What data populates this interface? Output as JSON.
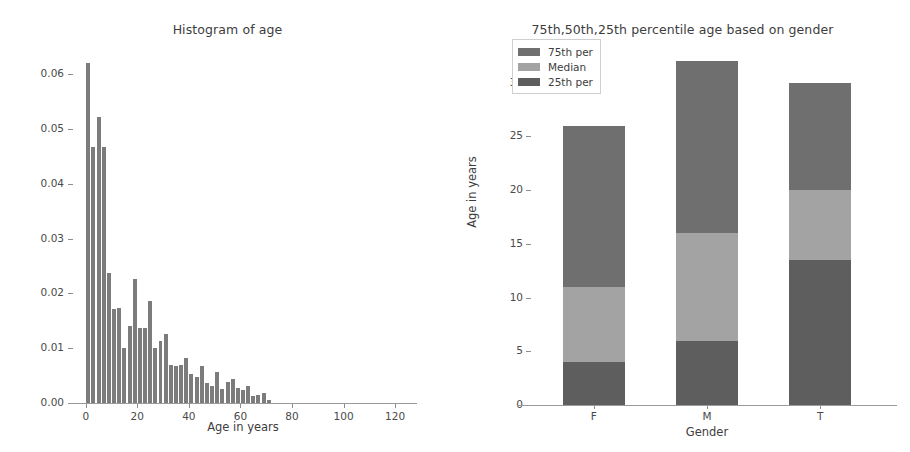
{
  "chart_data": [
    {
      "type": "bar",
      "title": "Histogram of age",
      "xlabel": "Age in years",
      "ylabel": "",
      "xlim": [
        -3,
        125
      ],
      "ylim": [
        0.0,
        0.0635
      ],
      "xticks": [
        "0",
        "20",
        "40",
        "60",
        "80",
        "100",
        "120"
      ],
      "xtick_values": [
        0,
        20,
        40,
        60,
        80,
        100,
        120
      ],
      "yticks": [
        "0.00",
        "0.01",
        "0.02",
        "0.03",
        "0.04",
        "0.05",
        "0.06"
      ],
      "ytick_values": [
        0.0,
        0.01,
        0.02,
        0.03,
        0.04,
        0.05,
        0.06
      ],
      "grid": false,
      "bar_color": "#7c7c7c",
      "bin_width": 2,
      "x": [
        1,
        3,
        5,
        7,
        9,
        11,
        13,
        15,
        17,
        19,
        21,
        23,
        25,
        27,
        29,
        31,
        33,
        35,
        37,
        39,
        41,
        43,
        45,
        47,
        49,
        51,
        53,
        55,
        57,
        59,
        61,
        63,
        65,
        67,
        69,
        71,
        73,
        75,
        77,
        79
      ],
      "values": [
        0.062,
        0.0467,
        0.0521,
        0.0467,
        0.0237,
        0.0172,
        0.0174,
        0.01,
        0.0141,
        0.0227,
        0.0137,
        0.0137,
        0.0186,
        0.01,
        0.0113,
        0.0126,
        0.007,
        0.0068,
        0.0069,
        0.0083,
        0.0053,
        0.0047,
        0.0068,
        0.0036,
        0.0031,
        0.0057,
        0.0025,
        0.0039,
        0.0044,
        0.0027,
        0.0023,
        0.0031,
        0.0013,
        0.0014,
        0.0018,
        0.0006,
        0.0,
        0.0,
        0.0,
        0.0
      ]
    },
    {
      "type": "bar",
      "subtype": "stacked",
      "title": "75th,50th,25th percentile age based on gender",
      "xlabel": "Gender",
      "ylabel": "Age in years",
      "categories": [
        "F",
        "M",
        "T"
      ],
      "ylim": [
        0,
        33.5
      ],
      "yticks": [
        "0",
        "5",
        "10",
        "15",
        "20",
        "25",
        "30"
      ],
      "ytick_values": [
        0,
        5,
        10,
        15,
        20,
        25,
        30
      ],
      "grid": false,
      "legend_position": "upper left",
      "series": [
        {
          "name": "75th per",
          "color": "#6f6f6f",
          "values": [
            26.0,
            32.0,
            30.0
          ]
        },
        {
          "name": "Median",
          "color": "#a3a3a3",
          "values": [
            11.0,
            16.0,
            20.0
          ]
        },
        {
          "name": "25th per",
          "color": "#5e5e5e",
          "values": [
            4.0,
            6.0,
            13.5
          ]
        }
      ]
    }
  ],
  "histogram": {
    "title": "Histogram of age",
    "xlabel": "Age in years"
  },
  "percentile_chart": {
    "title": "75th,50th,25th percentile age based on gender",
    "xlabel": "Gender",
    "ylabel": "Age in years",
    "legend": {
      "items": [
        {
          "label": "75th per"
        },
        {
          "label": "Median"
        },
        {
          "label": "25th per"
        }
      ]
    }
  }
}
